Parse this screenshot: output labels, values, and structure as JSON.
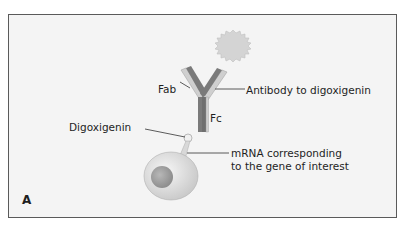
{
  "figure": {
    "panel_label": "A",
    "labels": {
      "fab": "Fab",
      "fc": "Fc",
      "antibody": "Antibody to digoxigenin",
      "digoxigenin": "Digoxigenin",
      "mrna_line1": "mRNA corresponding",
      "mrna_line2": "to the gene of interest"
    },
    "colors": {
      "background": "#f4f4f4",
      "border": "#5a5a5a",
      "heavy_chain": "#7a7a7a",
      "light_chain": "#c9c9c9",
      "reporter": "#d4d4d4",
      "cell": "#e6e6e6",
      "nucleus": "#a8a8a8"
    }
  }
}
